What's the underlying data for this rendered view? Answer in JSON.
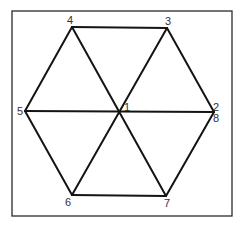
{
  "diagram": {
    "type": "hexagon-graph",
    "frame": {
      "x": 12,
      "y": 11,
      "width": 220,
      "height": 205
    },
    "vertices": [
      {
        "id": "1",
        "label": "1",
        "x": 120,
        "y": 112,
        "label_x": 124,
        "label_y": 111
      },
      {
        "id": "2",
        "label": "2",
        "x": 214,
        "y": 112,
        "label_x": 213,
        "label_y": 111
      },
      {
        "id": "3",
        "label": "3",
        "x": 167,
        "y": 28,
        "label_x": 165,
        "label_y": 25
      },
      {
        "id": "4",
        "label": "4",
        "x": 72,
        "y": 27,
        "label_x": 67,
        "label_y": 24
      },
      {
        "id": "5",
        "label": "5",
        "x": 25,
        "y": 111,
        "label_x": 17,
        "label_y": 115
      },
      {
        "id": "6",
        "label": "6",
        "x": 72,
        "y": 195,
        "label_x": 65,
        "label_y": 206
      },
      {
        "id": "7",
        "label": "7",
        "x": 166,
        "y": 196,
        "label_x": 164,
        "label_y": 207
      },
      {
        "id": "8",
        "label": "8",
        "x": 214,
        "y": 112,
        "label_x": 213,
        "label_y": 122
      }
    ],
    "edges": [
      {
        "from": "4",
        "to": "3"
      },
      {
        "from": "3",
        "to": "2"
      },
      {
        "from": "2",
        "to": "7"
      },
      {
        "from": "7",
        "to": "6"
      },
      {
        "from": "6",
        "to": "5"
      },
      {
        "from": "5",
        "to": "4"
      },
      {
        "from": "5",
        "to": "2"
      },
      {
        "from": "4",
        "to": "7"
      },
      {
        "from": "3",
        "to": "6"
      }
    ],
    "colors": {
      "edge": "#141414",
      "frame": "#2a2a2a",
      "label": "#333333",
      "background": "#ffffff"
    }
  }
}
